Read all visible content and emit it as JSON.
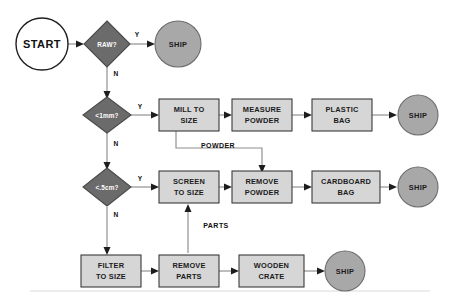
{
  "diagram": {
    "colors": {
      "decision_fill": "#6b6b6b",
      "decision_stroke": "#4a4a4a",
      "process_fill": "#d6d6d6",
      "process_stroke": "#3a3a3a",
      "terminal_fill": "#a8a8a8",
      "terminal_stroke": "#6d6d6d",
      "start_fill": "#ffffff",
      "start_stroke": "#1f1f1f",
      "connector": "#8d8d8d",
      "arrow": "#1d1d1d",
      "dark_text": "#1b1b1b",
      "light_text": "#ffffff"
    },
    "nodes": {
      "start": {
        "label": "START",
        "type": "start-terminal"
      },
      "decision_raw": {
        "label": "RAW?",
        "type": "decision"
      },
      "decision_1mm": {
        "label": "<1mm?",
        "type": "decision"
      },
      "decision_5cm": {
        "label": "<.5cm?",
        "type": "decision"
      },
      "mill_to_size": {
        "label_line1": "MILL TO",
        "label_line2": "SIZE",
        "type": "process"
      },
      "measure_powder": {
        "label_line1": "MEASURE",
        "label_line2": "POWDER",
        "type": "process"
      },
      "plastic_bag": {
        "label_line1": "PLASTIC",
        "label_line2": "BAG",
        "type": "process"
      },
      "screen_to_size": {
        "label_line1": "SCREEN",
        "label_line2": "TO SIZE",
        "type": "process"
      },
      "remove_powder": {
        "label_line1": "REMOVE",
        "label_line2": "POWDER",
        "type": "process"
      },
      "cardboard_bag": {
        "label_line1": "CARDBOARD",
        "label_line2": "BAG",
        "type": "process"
      },
      "filter_to_size": {
        "label_line1": "FILTER",
        "label_line2": "TO SIZE",
        "type": "process"
      },
      "remove_parts": {
        "label_line1": "REMOVE",
        "label_line2": "PARTS",
        "type": "process"
      },
      "wooden_crate": {
        "label_line1": "WOODEN",
        "label_line2": "CRATE",
        "type": "process"
      },
      "ship_raw": {
        "label": "SHIP",
        "type": "terminal"
      },
      "ship_plastic": {
        "label": "SHIP",
        "type": "terminal"
      },
      "ship_cardboard": {
        "label": "SHIP",
        "type": "terminal"
      },
      "ship_crate": {
        "label": "SHIP",
        "type": "terminal"
      }
    },
    "edge_labels": {
      "raw_yes": "Y",
      "raw_no": "N",
      "mm_yes": "Y",
      "mm_no": "N",
      "cm_yes": "Y",
      "cm_no": "N"
    },
    "flow_labels": {
      "powder": "POWDER",
      "parts": "PARTS"
    }
  }
}
